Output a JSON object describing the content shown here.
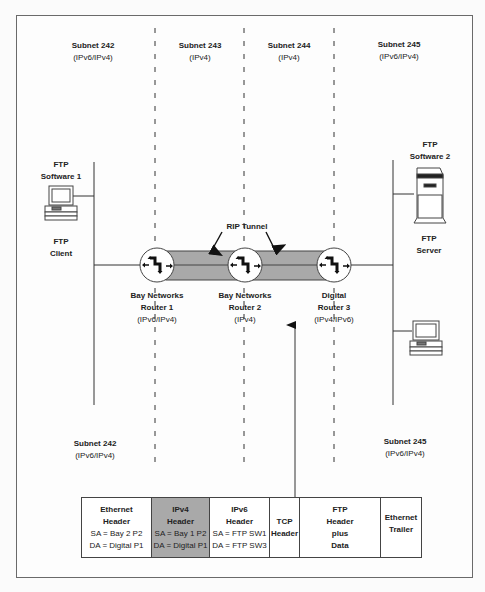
{
  "subnets_top": [
    {
      "name": "Subnet 242",
      "proto": "(IPv6/IPv4)"
    },
    {
      "name": "Subnet 243",
      "proto": "(IPv4)"
    },
    {
      "name": "Subnet 244",
      "proto": "(IPv4)"
    },
    {
      "name": "Subnet 245",
      "proto": "(IPv6/IPv4)"
    }
  ],
  "subnets_bottom": [
    {
      "name": "Subnet 242",
      "proto": "(IPv6/IPv4)"
    },
    {
      "name": "Subnet 245",
      "proto": "(IPv6/IPv4)"
    }
  ],
  "left_host": {
    "title_line1": "FTP",
    "title_line2": "Software 1",
    "role_line1": "FTP",
    "role_line2": "Client"
  },
  "right_host": {
    "title_line1": "FTP",
    "title_line2": "Software 2",
    "role_line1": "FTP",
    "role_line2": "Server"
  },
  "tunnel_label": "RIP Tunnel",
  "routers": [
    {
      "line1": "Bay Networks",
      "line2": "Router 1",
      "proto": "(IPv6/IPv4)"
    },
    {
      "line1": "Bay Networks",
      "line2": "Router 2",
      "proto": "(IPv4)"
    },
    {
      "line1": "Digital",
      "line2": "Router 3",
      "proto": "(IPv4/IPv6)"
    }
  ],
  "packet": [
    {
      "title1": "Ethernet",
      "title2": "Header",
      "sa": "SA = Bay 2 P2",
      "da": "DA = Digital P1",
      "shaded": false
    },
    {
      "title1": "IPv4",
      "title2": "Header",
      "sa": "SA = Bay 1 P2",
      "da": "DA = Digital P1",
      "shaded": true
    },
    {
      "title1": "IPv6",
      "title2": "Header",
      "sa": "SA = FTP SW1",
      "da": "DA = FTP SW3",
      "shaded": false
    },
    {
      "title1": "TCP",
      "title2": "Header"
    },
    {
      "title1": "FTP",
      "title2": "Header",
      "title3": "plus",
      "title4": "Data"
    },
    {
      "title1": "Ethernet",
      "title2": "Trailer"
    }
  ],
  "colors": {
    "tunnel_fill": "#a9a9a9",
    "shaded_cell": "#a9a9a9",
    "line": "#444444"
  }
}
